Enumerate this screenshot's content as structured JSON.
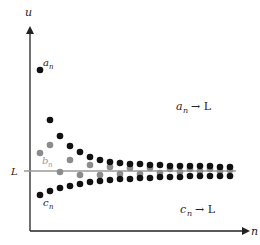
{
  "labels": {
    "y_axis": "u",
    "x_axis": "n",
    "limit": "L",
    "a_seq": "a",
    "a_sub": "n",
    "b_seq": "b",
    "b_sub": "n",
    "c_seq": "c",
    "c_sub": "n",
    "a_conv_lhs": "a",
    "a_conv_sub": "n",
    "a_conv_rhs": "→ L",
    "c_conv_lhs": "c",
    "c_conv_sub": "n",
    "c_conv_rhs": "→ L"
  },
  "colors": {
    "axis": "#222222",
    "limit_line": "#9a9a9a",
    "a_dots": "#111111",
    "b_dots": "#8c8c8c",
    "c_dots": "#111111"
  },
  "sequences": {
    "a": [
      [
        40,
        70
      ],
      [
        50,
        120
      ],
      [
        60,
        136
      ],
      [
        70,
        146
      ],
      [
        80,
        152
      ],
      [
        90,
        157
      ],
      [
        100,
        160
      ],
      [
        110,
        162
      ],
      [
        120,
        163
      ],
      [
        130,
        164
      ],
      [
        140,
        164
      ],
      [
        150,
        165
      ],
      [
        160,
        165
      ],
      [
        170,
        166
      ],
      [
        180,
        166
      ],
      [
        190,
        166
      ],
      [
        200,
        166
      ],
      [
        210,
        166
      ],
      [
        220,
        167
      ],
      [
        230,
        167
      ]
    ],
    "b": [
      [
        40,
        153
      ],
      [
        50,
        145
      ],
      [
        60,
        172
      ],
      [
        70,
        160
      ],
      [
        80,
        175
      ],
      [
        90,
        165
      ],
      [
        100,
        175
      ],
      [
        110,
        167
      ],
      [
        120,
        174
      ],
      [
        130,
        168
      ],
      [
        140,
        174
      ],
      [
        150,
        168
      ],
      [
        160,
        173
      ],
      [
        170,
        169
      ],
      [
        180,
        172
      ],
      [
        190,
        169
      ],
      [
        200,
        171
      ],
      [
        210,
        169
      ],
      [
        220,
        171
      ],
      [
        230,
        170
      ]
    ],
    "c": [
      [
        40,
        195
      ],
      [
        50,
        191
      ],
      [
        60,
        188
      ],
      [
        70,
        186
      ],
      [
        80,
        184
      ],
      [
        90,
        182
      ],
      [
        100,
        181
      ],
      [
        110,
        180
      ],
      [
        120,
        179
      ],
      [
        130,
        179
      ],
      [
        140,
        178
      ],
      [
        150,
        178
      ],
      [
        160,
        177
      ],
      [
        170,
        177
      ],
      [
        180,
        177
      ],
      [
        190,
        176
      ],
      [
        200,
        176
      ],
      [
        210,
        176
      ],
      [
        220,
        176
      ],
      [
        230,
        176
      ]
    ]
  }
}
